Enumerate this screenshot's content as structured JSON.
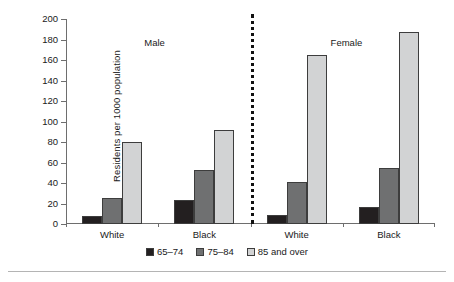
{
  "chart_data": {
    "type": "bar",
    "title": "",
    "subtitle": "",
    "xlabel": "",
    "ylabel": "Residents per 1000 population",
    "ylim": [
      0,
      200
    ],
    "y_ticks": [
      0,
      20,
      40,
      60,
      80,
      100,
      120,
      140,
      160,
      180,
      200
    ],
    "grid": false,
    "legend_position": "bottom",
    "panels": [
      {
        "name": "Male",
        "label": "Male"
      },
      {
        "name": "Female",
        "label": "Female"
      }
    ],
    "categories": [
      "White",
      "Black",
      "White",
      "Black"
    ],
    "group_panels": [
      "Male",
      "Male",
      "Female",
      "Female"
    ],
    "series": [
      {
        "name": "65–74",
        "color": "#231f20",
        "values": [
          8,
          23,
          9,
          17
        ]
      },
      {
        "name": "75–84",
        "color": "#6f7071",
        "values": [
          25,
          53,
          41,
          55
        ]
      },
      {
        "name": "85 and over",
        "color": "#d2d3d4",
        "values": [
          80,
          92,
          165,
          187
        ]
      }
    ],
    "annotations": [
      {
        "text": "Male",
        "kind": "panel-label"
      },
      {
        "text": "Female",
        "kind": "panel-label"
      },
      {
        "text": "dotted vertical divider between Male and Female panels",
        "kind": "divider"
      }
    ]
  },
  "axis": {
    "y_title": "Residents per 1000 population",
    "y_tick_labels": [
      "0",
      "20",
      "40",
      "60",
      "80",
      "100",
      "120",
      "140",
      "160",
      "180",
      "200"
    ],
    "x_tick_labels": [
      "White",
      "Black",
      "White",
      "Black"
    ]
  },
  "panels": {
    "male_label": "Male",
    "female_label": "Female"
  },
  "legend": {
    "items": [
      {
        "label": "65–74",
        "color": "#231f20"
      },
      {
        "label": "75–84",
        "color": "#6f7071"
      },
      {
        "label": "85 and over",
        "color": "#d2d3d4"
      }
    ]
  }
}
